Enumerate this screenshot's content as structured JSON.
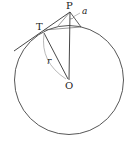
{
  "diagram": {
    "type": "geometry",
    "colors": {
      "stroke": "#333333",
      "thin_stroke": "#777777",
      "background": "#ffffff"
    },
    "points": {
      "P": {
        "label": "P",
        "x": 70,
        "y": 12
      },
      "T": {
        "label": "T",
        "x": 44,
        "y": 30
      },
      "O": {
        "label": "O",
        "x": 69,
        "y": 80
      }
    },
    "circle": {
      "cx": 69,
      "cy": 80,
      "r": 55
    },
    "labels": {
      "radius": "r",
      "angle": "a"
    }
  }
}
